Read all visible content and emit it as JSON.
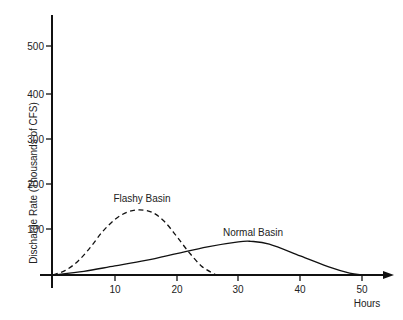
{
  "chart_data": {
    "type": "line",
    "title": "",
    "xlabel": "Hours",
    "ylabel": "Discharge Rate (Thousands of CFS)",
    "xlim": [
      0,
      55
    ],
    "ylim": [
      0,
      560
    ],
    "x_ticks": [
      10,
      20,
      30,
      40,
      50
    ],
    "y_ticks": [
      100,
      200,
      300,
      400,
      500
    ],
    "grid": false,
    "legend": "inline labels",
    "series": [
      {
        "name": "Flashy Basin",
        "style": "dashed",
        "x": [
          0,
          2,
          4,
          6,
          8,
          10,
          12,
          14,
          16,
          18,
          20,
          22,
          24,
          26,
          26.5
        ],
        "y": [
          0,
          10,
          30,
          60,
          95,
          122,
          138,
          143,
          138,
          118,
          85,
          50,
          20,
          3,
          0
        ]
      },
      {
        "name": "Normal Basin",
        "style": "solid",
        "x": [
          0,
          5,
          10,
          15,
          20,
          25,
          30,
          32,
          35,
          40,
          45,
          48,
          50
        ],
        "y": [
          0,
          8,
          20,
          32,
          47,
          62,
          73,
          74,
          68,
          42,
          16,
          4,
          0
        ]
      }
    ]
  },
  "labels": {
    "ylabel": "Discharge Rate (Thousands of CFS)",
    "xlabel": "Hours",
    "flashy": "Flashy Basin",
    "normal": "Normal Basin",
    "y500": "500",
    "y400": "400",
    "y300": "300",
    "y200": "200",
    "y100": "100",
    "x10": "10",
    "x20": "20",
    "x30": "30",
    "x40": "40",
    "x50": "50"
  }
}
